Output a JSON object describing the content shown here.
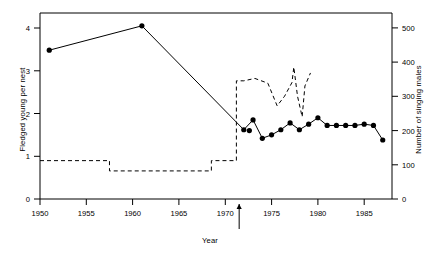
{
  "figure": {
    "background_color": "#ffffff",
    "line_color": "#000000"
  },
  "chart_data": {
    "type": "line",
    "title": "",
    "xlabel": "Year",
    "ylabel": "Fledged young per nest",
    "ylabel_right": "Number of singing males",
    "xlim": [
      1950,
      1988
    ],
    "ylim": [
      0,
      4.35
    ],
    "ylim_right": [
      0,
      543
    ],
    "grid": false,
    "legend": null,
    "x_ticks": [
      1950,
      1955,
      1960,
      1965,
      1970,
      1975,
      1980,
      1985
    ],
    "x_tick_labels": [
      "1950",
      "1955",
      "1960",
      "1965",
      "1970",
      "1975",
      "1980",
      "1985"
    ],
    "y_ticks": [
      0,
      1,
      2,
      3,
      4
    ],
    "y_tick_labels": [
      "0",
      "1",
      "2",
      "3",
      "4"
    ],
    "y_ticks_right": [
      0,
      100,
      200,
      300,
      400,
      500
    ],
    "y_tick_labels_right": [
      "0",
      "100",
      "200",
      "300",
      "400",
      "500"
    ],
    "series": [
      {
        "name": "Fledged young per nest",
        "axis": "left",
        "style": "solid-with-markers",
        "marker": "filled-circle",
        "x": [
          1951,
          1961,
          1972,
          1973,
          1974,
          1975,
          1976,
          1977,
          1978,
          1979,
          1980,
          1981,
          1982,
          1983,
          1984,
          1985,
          1986,
          1987
        ],
        "y": [
          3.48,
          4.05,
          1.62,
          1.85,
          1.42,
          1.5,
          1.62,
          1.78,
          1.62,
          1.75,
          1.9,
          1.72,
          1.72,
          1.72,
          1.72,
          1.75,
          1.72,
          1.38
        ]
      },
      {
        "name": "Fledged young per nest (extra points near 1972)",
        "axis": "left",
        "style": "markers-only",
        "marker": "filled-circle",
        "x": [
          1972.6
        ],
        "y": [
          1.6
        ]
      },
      {
        "name": "Number of singing males",
        "axis": "right",
        "style": "dashed",
        "marker": "none",
        "x": [
          1950,
          1957.5,
          1957.5,
          1968.5,
          1968.5,
          1971.2,
          1971.2,
          1972,
          1973.2,
          1974.6,
          1975.6,
          1976.4,
          1977.2,
          1977.4,
          1977.8,
          1978.3,
          1978.6,
          1979.2
        ],
        "y": [
          112,
          112,
          82,
          82,
          112,
          112,
          345,
          345,
          352,
          338,
          272,
          300,
          340,
          385,
          300,
          240,
          330,
          368
        ]
      }
    ],
    "annotations": [
      {
        "name": "intervention-arrow",
        "type": "arrow-up",
        "x": 1971.5,
        "y": 0,
        "label": ""
      }
    ]
  }
}
